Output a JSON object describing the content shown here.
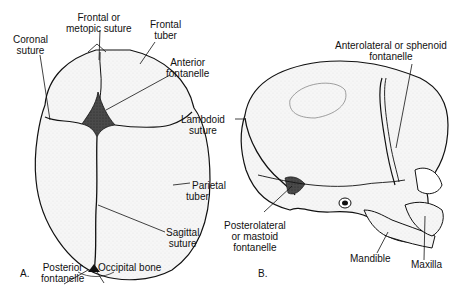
{
  "figure": {
    "panels": [
      {
        "id": "A",
        "letter": "A.",
        "view": "superior view of neonatal skull",
        "labels": {
          "frontal_suture_1": "Frontal or",
          "frontal_suture_2": "metopic suture",
          "frontal_tuber_1": "Frontal",
          "frontal_tuber_2": "tuber",
          "coronal_1": "Coronal",
          "coronal_2": "suture",
          "anterior_fontanelle_1": "Anterior",
          "anterior_fontanelle_2": "fontanelle",
          "parietal_tuber_1": "Parietal",
          "parietal_tuber_2": "tuber",
          "sagittal_1": "Sagittal",
          "sagittal_2": "suture",
          "posterior_fontanelle_1": "Posterior",
          "posterior_fontanelle_2": "fontanelle",
          "occipital_bone": "Occipital bone"
        }
      },
      {
        "id": "B",
        "letter": "B.",
        "view": "lateral view of neonatal skull",
        "labels": {
          "anterolateral_1": "Anterolateral or sphenoid",
          "anterolateral_2": "fontanelle",
          "lambdoid_1": "Lambdoid",
          "lambdoid_2": "suture",
          "posterolateral_1": "Posterolateral",
          "posterolateral_2": "or mastoid",
          "posterolateral_3": "fontanelle",
          "mandible": "Mandible",
          "maxilla": "Maxilla"
        }
      }
    ],
    "colors": {
      "ink": "#111111",
      "bone_fill": "#f4f4f4",
      "fontanelle_fill": "#3a3a3a",
      "background": "#ffffff"
    }
  }
}
